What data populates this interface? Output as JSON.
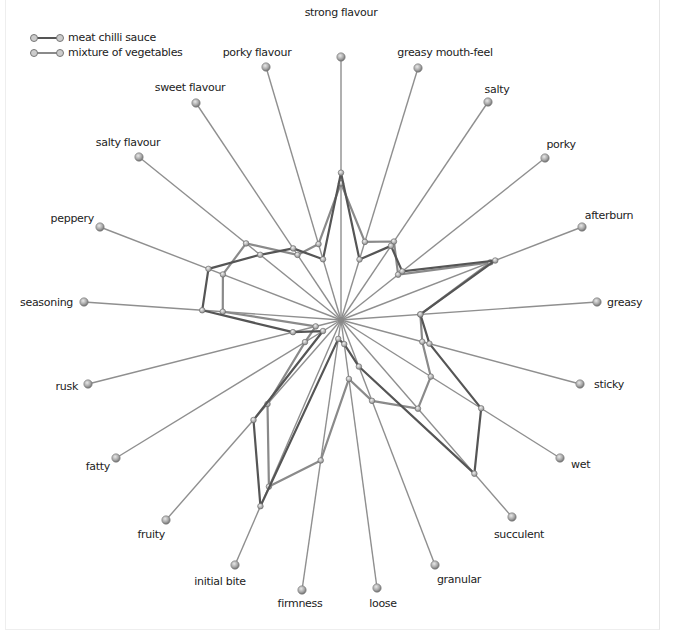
{
  "chart_data": {
    "type": "radar",
    "title": "",
    "center": [
      341,
      320
    ],
    "legend": {
      "position": "top-left",
      "entries": [
        {
          "name": "meat chilli sauce",
          "color": "#555555"
        },
        {
          "name": "mixture of vegetables",
          "color": "#8a8a8a"
        }
      ]
    },
    "axes": [
      {
        "label": "strong flavour",
        "end": [
          341,
          57
        ],
        "anchor": "middle",
        "lx": 341,
        "ly": 16
      },
      {
        "label": "greasy mouth-feel",
        "end": [
          418,
          68
        ],
        "anchor": "middle",
        "lx": 445,
        "ly": 56
      },
      {
        "label": "salty",
        "end": [
          488,
          102
        ],
        "anchor": "middle",
        "lx": 497,
        "ly": 93
      },
      {
        "label": "porky",
        "end": [
          545,
          158
        ],
        "anchor": "middle",
        "lx": 561,
        "ly": 148
      },
      {
        "label": "afterburn",
        "end": [
          582,
          227
        ],
        "anchor": "middle",
        "lx": 609,
        "ly": 219
      },
      {
        "label": "greasy",
        "end": [
          597,
          302
        ],
        "anchor": "start",
        "lx": 607,
        "ly": 306
      },
      {
        "label": "sticky",
        "end": [
          580,
          384
        ],
        "anchor": "start",
        "lx": 594,
        "ly": 388
      },
      {
        "label": "wet",
        "end": [
          560,
          458
        ],
        "anchor": "start",
        "lx": 571,
        "ly": 468
      },
      {
        "label": "succulent",
        "end": [
          512,
          517
        ],
        "anchor": "middle",
        "lx": 519,
        "ly": 538
      },
      {
        "label": "granular",
        "end": [
          435,
          565
        ],
        "anchor": "middle",
        "lx": 459,
        "ly": 583
      },
      {
        "label": "loose",
        "end": [
          377,
          588
        ],
        "anchor": "middle",
        "lx": 383,
        "ly": 607
      },
      {
        "label": "firmness",
        "end": [
          302,
          590
        ],
        "anchor": "middle",
        "lx": 300,
        "ly": 607
      },
      {
        "label": "initial bite",
        "end": [
          235,
          565
        ],
        "anchor": "middle",
        "lx": 220,
        "ly": 585
      },
      {
        "label": "fruity",
        "end": [
          166,
          520
        ],
        "anchor": "end",
        "lx": 165,
        "ly": 538
      },
      {
        "label": "fatty",
        "end": [
          116,
          458
        ],
        "anchor": "end",
        "lx": 110,
        "ly": 470
      },
      {
        "label": "rusk",
        "end": [
          88,
          384
        ],
        "anchor": "end",
        "lx": 78,
        "ly": 390
      },
      {
        "label": "seasoning",
        "end": [
          84,
          302
        ],
        "anchor": "end",
        "lx": 73,
        "ly": 306
      },
      {
        "label": "peppery",
        "end": [
          100,
          227
        ],
        "anchor": "end",
        "lx": 94,
        "ly": 222
      },
      {
        "label": "salty flavour",
        "end": [
          139,
          157
        ],
        "anchor": "middle",
        "lx": 128,
        "ly": 146
      },
      {
        "label": "sweet flavour",
        "end": [
          196,
          103
        ],
        "anchor": "middle",
        "lx": 190,
        "ly": 91
      },
      {
        "label": "porky flavour",
        "end": [
          266,
          67
        ],
        "anchor": "middle",
        "lx": 257,
        "ly": 56
      }
    ],
    "series": [
      {
        "name": "meat chilli sauce",
        "color": "#555555",
        "values": [
          0.56,
          0.24,
          0.34,
          0.3,
          0.64,
          0.31,
          0.37,
          0.64,
          0.78,
          0.19,
          0.09,
          0.07,
          0.76,
          0.5,
          0.08,
          0.19,
          0.54,
          0.55,
          0.4,
          0.33,
          0.24
        ]
      },
      {
        "name": "mixture of vegetables",
        "color": "#8a8a8a",
        "values": [
          0.52,
          0.31,
          0.36,
          0.28,
          0.62,
          0.31,
          0.34,
          0.41,
          0.45,
          0.33,
          0.22,
          0.52,
          0.68,
          0.42,
          0.16,
          0.1,
          0.46,
          0.49,
          0.47,
          0.3,
          0.3
        ]
      }
    ],
    "range": [
      0,
      1
    ],
    "grid": false
  }
}
